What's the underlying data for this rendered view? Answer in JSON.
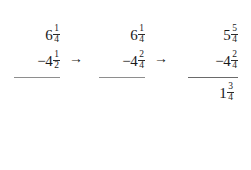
{
  "problem": {
    "description": "Mixed number subtraction with regrouping, three stages",
    "stages": [
      {
        "id": "stage-original",
        "minuend": {
          "sign": "",
          "whole": "6",
          "numerator": "1",
          "denominator": "4"
        },
        "subtrahend": {
          "sign": "−",
          "whole": "4",
          "numerator": "1",
          "denominator": "2"
        },
        "result": null
      },
      {
        "id": "stage-common-denominator",
        "minuend": {
          "sign": "",
          "whole": "6",
          "numerator": "1",
          "denominator": "4"
        },
        "subtrahend": {
          "sign": "−",
          "whole": "4",
          "numerator": "2",
          "denominator": "4"
        },
        "result": null
      },
      {
        "id": "stage-regrouped",
        "minuend": {
          "sign": "",
          "whole": "5",
          "numerator": "5",
          "denominator": "4"
        },
        "subtrahend": {
          "sign": "−",
          "whole": "4",
          "numerator": "2",
          "denominator": "4"
        },
        "result": {
          "sign": "",
          "whole": "1",
          "numerator": "3",
          "denominator": "4"
        }
      }
    ],
    "arrows": [
      {
        "glyph": "→",
        "label": "arrow-to-common-denominator"
      },
      {
        "glyph": "→",
        "label": "arrow-to-regrouped"
      }
    ],
    "colors": {
      "text": "#1a1a1a",
      "rule": "#8e8e8e",
      "background": "#ffffff"
    }
  }
}
